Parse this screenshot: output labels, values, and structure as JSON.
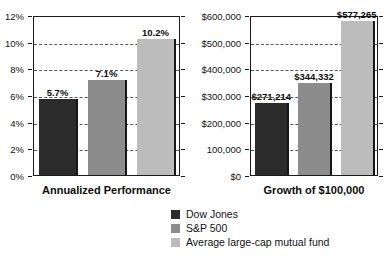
{
  "series_colors": {
    "dow_jones": "#2b2b2b",
    "sp500": "#8c8c8c",
    "avg_fund": "#bcbcbc"
  },
  "legend": {
    "items": [
      {
        "label": "Dow Jones",
        "color": "#2b2b2b",
        "swatch_name": "dow-jones"
      },
      {
        "label": "S&P 500",
        "color": "#8c8c8c",
        "swatch_name": "sp500"
      },
      {
        "label": "Average large-cap mutual fund",
        "color": "#bcbcbc",
        "swatch_name": "avg-large-cap-mutual-fund"
      }
    ]
  },
  "chart_data": [
    {
      "type": "bar",
      "title": "",
      "xlabel": "Annualized Performance",
      "ylabel": "",
      "categories": [
        "Dow Jones",
        "S&P 500",
        "Average large-cap mutual fund"
      ],
      "values": [
        5.7,
        7.1,
        10.2
      ],
      "data_labels": [
        "5.7%",
        "7.1%",
        "10.2%"
      ],
      "ylim": [
        0,
        12
      ],
      "ytick_values": [
        0,
        2,
        4,
        6,
        8,
        10,
        12
      ],
      "ytick_labels": [
        "0%",
        "2%",
        "4%",
        "6%",
        "8%",
        "10%",
        "12%"
      ],
      "grid": true,
      "legend_position": "bottom-center"
    },
    {
      "type": "bar",
      "title": "",
      "xlabel": "Growth of $100,000",
      "ylabel": "",
      "categories": [
        "Dow Jones",
        "S&P 500",
        "Average large-cap mutual fund"
      ],
      "values": [
        271214,
        344332,
        577265
      ],
      "data_labels": [
        "$271,214",
        "$344,332",
        "$577,265"
      ],
      "ylim": [
        0,
        600000
      ],
      "ytick_values": [
        0,
        100000,
        200000,
        300000,
        400000,
        500000,
        600000
      ],
      "ytick_labels": [
        "$0",
        "100,000",
        "$200,000",
        "$300,000",
        "$400,000",
        "$500,000",
        "$600,000"
      ],
      "grid": true,
      "legend_position": "bottom-center"
    }
  ]
}
